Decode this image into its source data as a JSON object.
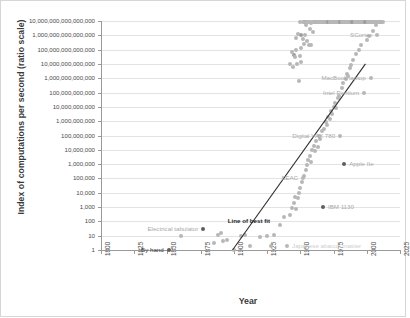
{
  "chart_data": {
    "type": "scatter",
    "title": "",
    "xlabel": "Year",
    "ylabel": "Index of computations per second (ratio scale)",
    "xlim": [
      1800,
      2025
    ],
    "ylim": [
      1,
      1e+16
    ],
    "yscale": "log",
    "grid": true,
    "legend": "none",
    "x_ticks": [
      "1800",
      "1825",
      "1850",
      "1875",
      "1900",
      "1925",
      "1950",
      "1975",
      "2000",
      "2025"
    ],
    "y_ticks": [
      "10,000,000,000,000,000",
      "1,000,000,000,000,000",
      "100,000,000,000,000",
      "10,000,000,000,000",
      "1,000,000,000,000",
      "100,000,000,000",
      "10,000,000,000",
      "1,000,000,000",
      "100,000,000",
      "10,000,000",
      "1,000,000",
      "100,000",
      "10,000",
      "1,000",
      "100",
      "10",
      "1"
    ],
    "annotations": [
      {
        "label": "SCortex",
        "x": 2008,
        "y": 1000000000000000.0
      },
      {
        "label": "MacBook laptop",
        "x": 2003,
        "y": 1000000000000.0
      },
      {
        "label": "Intel Pentium",
        "x": 1998,
        "y": 100000000000.0
      },
      {
        "label": "Digital VAX 780",
        "x": 1980,
        "y": 100000000.0
      },
      {
        "label": "Apple IIe",
        "x": 1983,
        "y": 1000000
      },
      {
        "label": "SEAC",
        "x": 1952,
        "y": 100000
      },
      {
        "label": "IBM 1130",
        "x": 1967,
        "y": 1000
      },
      {
        "label": "Line of best fit",
        "x": 1931,
        "y": 100
      },
      {
        "label": "Electrical tabulator",
        "x": 1877,
        "y": 30
      },
      {
        "label": "By hand",
        "x": 1851,
        "y": 1
      },
      {
        "label": "Japanese abacus master",
        "x": 1940,
        "y": 2
      }
    ],
    "series": [
      {
        "name": "Computing devices",
        "points": [
          [
            1851,
            1
          ],
          [
            1860,
            10
          ],
          [
            1877,
            30
          ],
          [
            1885,
            3
          ],
          [
            1888,
            12
          ],
          [
            1890,
            15
          ],
          [
            1892,
            4
          ],
          [
            1895,
            5
          ],
          [
            1900,
            1
          ],
          [
            1905,
            9
          ],
          [
            1908,
            11
          ],
          [
            1912,
            2
          ],
          [
            1920,
            8
          ],
          [
            1925,
            9
          ],
          [
            1928,
            2
          ],
          [
            1930,
            11
          ],
          [
            1935,
            60
          ],
          [
            1938,
            200
          ],
          [
            1940,
            2
          ],
          [
            1942,
            300
          ],
          [
            1944,
            900
          ],
          [
            1945,
            2000
          ],
          [
            1946,
            5000
          ],
          [
            1947,
            700
          ],
          [
            1948,
            4000
          ],
          [
            1949,
            9000
          ],
          [
            1950,
            20000
          ],
          [
            1951,
            60000
          ],
          [
            1952,
            100000
          ],
          [
            1953,
            150000
          ],
          [
            1954,
            400000
          ],
          [
            1955,
            900000
          ],
          [
            1956,
            2000000
          ],
          [
            1957,
            4000000
          ],
          [
            1958,
            1500000
          ],
          [
            1959,
            9000000
          ],
          [
            1960,
            20000000
          ],
          [
            1961,
            8000000
          ],
          [
            1962,
            40000000
          ],
          [
            1963,
            15000000
          ],
          [
            1964,
            90000000
          ],
          [
            1965,
            60000000
          ],
          [
            1966,
            200000000
          ],
          [
            1967,
            1000
          ],
          [
            1968,
            300000000
          ],
          [
            1969,
            900000000
          ],
          [
            1970,
            500000000
          ],
          [
            1971,
            2000000000
          ],
          [
            1972,
            1500000000
          ],
          [
            1973,
            5000000000
          ],
          [
            1974,
            3000000000
          ],
          [
            1975,
            10000000000
          ],
          [
            1976,
            20000000000
          ],
          [
            1977,
            8000000000
          ],
          [
            1978,
            40000000000
          ],
          [
            1979,
            60000000000
          ],
          [
            1980,
            100000000
          ],
          [
            1981,
            200000000000
          ],
          [
            1982,
            500000000000
          ],
          [
            1983,
            1000000
          ],
          [
            1984,
            900000000000
          ],
          [
            1985,
            2000000000000
          ],
          [
            1986,
            1500000000000
          ],
          [
            1987,
            5000000000000
          ],
          [
            1988,
            9000000000000
          ],
          [
            1990,
            20000000000000
          ],
          [
            1992,
            50000000000000
          ],
          [
            1994,
            90000000000000
          ],
          [
            1996,
            200000000000000
          ],
          [
            1998,
            100000000000.0
          ],
          [
            2000,
            500000000000000
          ],
          [
            2002,
            900000000000000
          ],
          [
            2003,
            1000000000000.0
          ],
          [
            2005,
            2000000000000000
          ],
          [
            2007,
            5000000000000000
          ],
          [
            2008,
            1000000000000000.0
          ],
          [
            2010,
            9000000000000000
          ]
        ]
      }
    ],
    "best_fit_line": {
      "label": "Line of best fit",
      "x_start": 1899,
      "y_start": 1,
      "x_end": 1999,
      "y_end": 10000000000000.0
    }
  }
}
